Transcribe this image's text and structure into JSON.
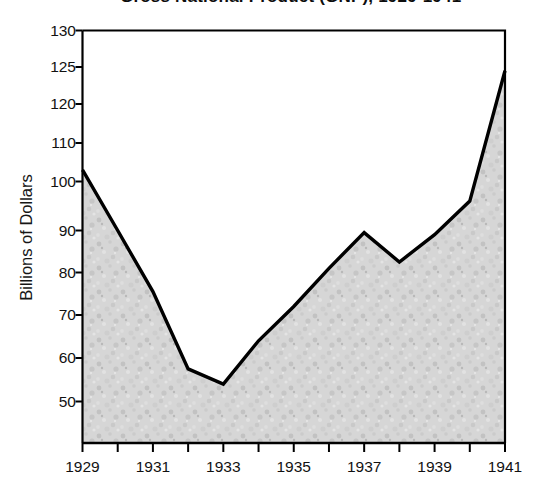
{
  "chart_data": {
    "type": "area",
    "title": "Gross National Product (GNP), 1929-1941",
    "title_visible_fragment": "",
    "xlabel": "",
    "ylabel": "Billions of Dollars",
    "x": [
      1929,
      1930,
      1931,
      1932,
      1933,
      1934,
      1935,
      1936,
      1937,
      1938,
      1939,
      1940,
      1941
    ],
    "values": [
      103.0,
      90.0,
      75.5,
      57.5,
      54.0,
      64.0,
      72.0,
      81.0,
      89.5,
      82.5,
      89.0,
      96.0,
      124.5
    ],
    "series": [
      {
        "name": "Billions of Dollars",
        "values": [
          103.0,
          90.0,
          75.5,
          57.5,
          54.0,
          64.0,
          72.0,
          81.0,
          89.5,
          82.5,
          89.0,
          96.0,
          124.5
        ]
      }
    ],
    "ylim": [
      44,
      130
    ],
    "xlim": [
      1929,
      1941
    ],
    "ytick_labels": [
      "130",
      "125",
      "120",
      "110",
      "100",
      "90",
      "80",
      "70",
      "60",
      "50"
    ],
    "ytick_values": [
      130,
      125,
      120,
      110,
      100,
      90,
      80,
      70,
      60,
      50
    ],
    "xtick_labels": [
      "1929",
      "1931",
      "1933",
      "1935",
      "1937",
      "1939",
      "1941"
    ],
    "xtick_values": [
      1929,
      1931,
      1933,
      1935,
      1937,
      1939,
      1941
    ],
    "xminor_ticks": [
      1930,
      1932,
      1934,
      1936,
      1938,
      1940
    ],
    "grid": false,
    "legend": "none",
    "fill_color": "#d2d2d2",
    "line_color": "#000000",
    "axis_color": "#000000"
  },
  "axes": {
    "y_title": "Billions of Dollars"
  }
}
